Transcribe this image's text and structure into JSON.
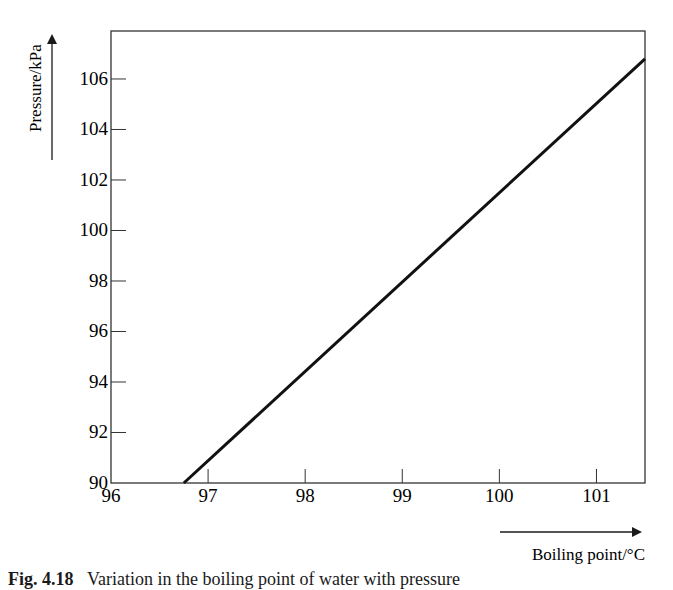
{
  "chart_data": {
    "type": "line",
    "title": "",
    "xlabel": "Boiling point/°C",
    "ylabel": "Pressure/kPa",
    "xlim": [
      96,
      101.5
    ],
    "ylim": [
      90,
      107.9
    ],
    "x_ticks": [
      96,
      97,
      98,
      99,
      100,
      101
    ],
    "y_ticks": [
      90,
      92,
      94,
      96,
      98,
      100,
      102,
      104,
      106
    ],
    "grid": false,
    "legend": null,
    "series": [
      {
        "name": "Pressure vs boiling point",
        "x": [
          96.75,
          101.5
        ],
        "y": [
          90,
          106.8
        ]
      }
    ]
  },
  "caption": {
    "label": "Fig. 4.18",
    "text": "Variation in the boiling point of water with pressure"
  }
}
